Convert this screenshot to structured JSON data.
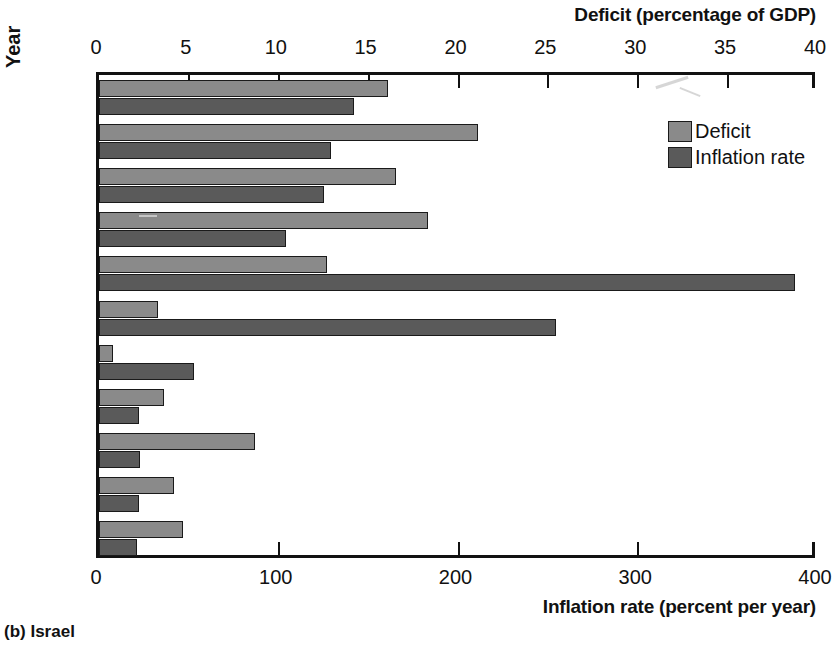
{
  "figure": {
    "caption": "(b) Israel",
    "y_axis_title": "Year",
    "top_axis_title": "Deficit (percentage of GDP)",
    "bottom_axis_title": "Inflation rate (percent per year)"
  },
  "legend": {
    "position": "top-right-inside",
    "items": [
      {
        "label": "Deficit",
        "color": "#8a8a8a"
      },
      {
        "label": "Inflation rate",
        "color": "#5a5a5a"
      }
    ]
  },
  "chart_data": {
    "type": "bar",
    "orientation": "horizontal",
    "title": "(b) Israel",
    "xlabel": "Inflation rate (percent per year)",
    "xlabel_top": "Deficit (percentage of GDP)",
    "ylabel": "Year",
    "grid": false,
    "categories": [
      "1980",
      "1981",
      "1982",
      "1983",
      "1984",
      "1985",
      "1986",
      "1987",
      "1988",
      "1989",
      "1990"
    ],
    "series": [
      {
        "name": "Deficit",
        "units": "percentage of GDP",
        "axis": "top",
        "color": "#8a8a8a",
        "xlim": [
          0,
          40
        ],
        "xticks": [
          0,
          5,
          10,
          15,
          20,
          25,
          30,
          35,
          40
        ],
        "values": [
          16.1,
          21.1,
          16.5,
          18.3,
          12.7,
          3.3,
          0.8,
          3.6,
          8.7,
          4.2,
          4.7
        ]
      },
      {
        "name": "Inflation rate",
        "units": "percent per year",
        "axis": "bottom",
        "color": "#5a5a5a",
        "xlim": [
          0,
          400
        ],
        "xticks": [
          0,
          100,
          200,
          300,
          400
        ],
        "values": [
          142,
          129,
          125,
          104,
          387,
          254,
          53,
          22,
          23,
          22,
          21
        ]
      }
    ]
  }
}
